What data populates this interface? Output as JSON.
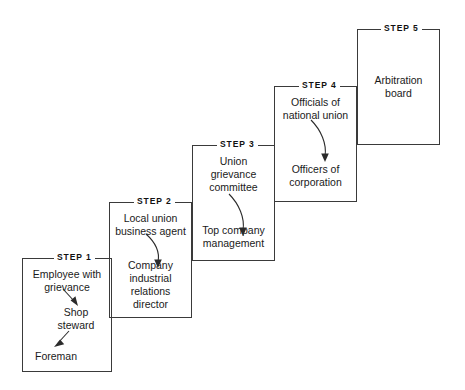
{
  "diagram": {
    "type": "staircase-flow",
    "line_color": "#3a3a3a",
    "text_color": "#1a1a1a",
    "background": "#ffffff",
    "steps": [
      {
        "id": "step-1",
        "label": "STEP 1",
        "entries": [
          {
            "name": "employee-with-grievance",
            "text": "Employee with\ngrievance"
          },
          {
            "name": "shop-steward",
            "text": "Shop\nsteward"
          },
          {
            "name": "foreman",
            "text": "Foreman"
          }
        ]
      },
      {
        "id": "step-2",
        "label": "STEP 2",
        "entries": [
          {
            "name": "local-union-business-agent",
            "text": "Local union\nbusiness agent"
          },
          {
            "name": "company-industrial-relations-director",
            "text": "Company\nindustrial\nrelations\ndirector"
          }
        ]
      },
      {
        "id": "step-3",
        "label": "STEP 3",
        "entries": [
          {
            "name": "union-grievance-committee",
            "text": "Union\ngrievance\ncommittee"
          },
          {
            "name": "top-company-management",
            "text": "Top company\nmanagement"
          }
        ]
      },
      {
        "id": "step-4",
        "label": "STEP 4",
        "entries": [
          {
            "name": "officials-of-national-union",
            "text": "Officials of\nnational union"
          },
          {
            "name": "officers-of-corporation",
            "text": "Officers of\ncorporation"
          }
        ]
      },
      {
        "id": "step-5",
        "label": "STEP 5",
        "entries": [
          {
            "name": "arbitration-board",
            "text": "Arbitration\nboard"
          }
        ]
      }
    ]
  }
}
